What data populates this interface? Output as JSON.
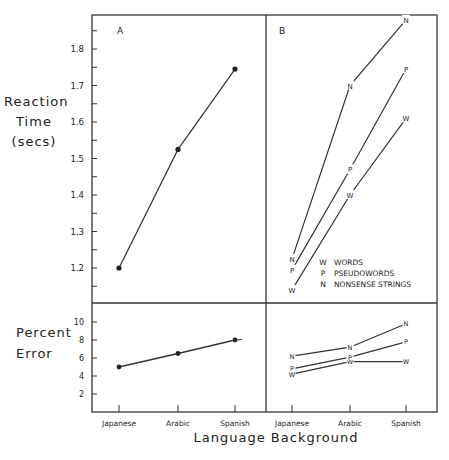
{
  "figure": {
    "ylabel_top": [
      "Reaction",
      "Time",
      "(secs)"
    ],
    "ylabel_bottom": [
      "Percent",
      "Error"
    ],
    "xlabel": "Language Background",
    "panel_a_label": "A",
    "panel_b_label": "B",
    "categories": [
      "Japanese",
      "Arabic",
      "Spanish"
    ],
    "rt_ticks": [
      "1.8",
      "1.7",
      "1.6",
      "1.5",
      "1.4",
      "1.3",
      "1.2"
    ],
    "err_ticks": [
      "10",
      "8",
      "6",
      "4",
      "2"
    ],
    "legend": [
      {
        "marker": "W",
        "label": "WORDS"
      },
      {
        "marker": "P",
        "label": "PSEUDOWORDS"
      },
      {
        "marker": "N",
        "label": "NONSENSE STRINGS"
      }
    ]
  },
  "chart_data": [
    {
      "type": "line",
      "title": "A",
      "xlabel": "Language Background",
      "ylabel": "Reaction Time (secs)",
      "categories": [
        "Japanese",
        "Arabic",
        "Spanish"
      ],
      "values": [
        1.2,
        1.525,
        1.745
      ],
      "ylim": [
        1.1,
        1.9
      ],
      "grid": false
    },
    {
      "type": "line",
      "title": "B",
      "xlabel": "Language Background",
      "ylabel": "Reaction Time (secs)",
      "categories": [
        "Japanese",
        "Arabic",
        "Spanish"
      ],
      "series": [
        {
          "name": "W WORDS",
          "values": [
            1.14,
            1.4,
            1.61
          ]
        },
        {
          "name": "P PSEUDOWORDS",
          "values": [
            1.195,
            1.47,
            1.745
          ]
        },
        {
          "name": "N NONSENSE STRINGS",
          "values": [
            1.225,
            1.7,
            1.88
          ]
        }
      ],
      "ylim": [
        1.1,
        1.9
      ],
      "legend_position": "lower right",
      "grid": false
    },
    {
      "type": "line",
      "title": "A (lower)",
      "xlabel": "Language Background",
      "ylabel": "Percent Error",
      "categories": [
        "Japanese",
        "Arabic",
        "Spanish"
      ],
      "values": [
        5.0,
        6.5,
        8.0
      ],
      "ylim": [
        0,
        12
      ],
      "grid": false
    },
    {
      "type": "line",
      "title": "B (lower)",
      "xlabel": "Language Background",
      "ylabel": "Percent Error",
      "categories": [
        "Japanese",
        "Arabic",
        "Spanish"
      ],
      "series": [
        {
          "name": "W WORDS",
          "values": [
            4.2,
            5.6,
            5.6
          ]
        },
        {
          "name": "P PSEUDOWORDS",
          "values": [
            4.8,
            6.1,
            7.8
          ]
        },
        {
          "name": "N NONSENSE STRINGS",
          "values": [
            6.2,
            7.2,
            9.8
          ]
        }
      ],
      "ylim": [
        0,
        12
      ],
      "grid": false
    }
  ]
}
